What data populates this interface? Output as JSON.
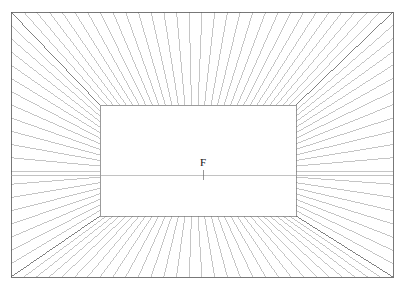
{
  "figure": {
    "type": "perspective-grid-diagram",
    "width": 405,
    "height": 284,
    "background_color": "#ffffff"
  },
  "labels": {
    "vanishing_point": "F"
  },
  "chart_data": {
    "type": "diagram",
    "projection": "one-point-perspective",
    "vanishing_point": {
      "label": "F",
      "x": 203,
      "y": 175
    },
    "horizon_line": {
      "y": 175,
      "x_start": 11,
      "x_end": 393
    },
    "outer_frame": {
      "x_left": 11,
      "y_top": 12,
      "x_right": 393,
      "y_bottom": 277
    },
    "back_wall": {
      "x_left": 100,
      "y_top": 105,
      "x_right": 296,
      "y_bottom": 216
    },
    "surfaces": [
      "ceiling",
      "floor",
      "left-wall",
      "right-wall",
      "back-wall"
    ],
    "grid": {
      "horizontal_divisions_top": 30,
      "vertical_divisions_side": 20,
      "depth_steps": 14,
      "line_color": "#8c8c8c",
      "line_width": 0.5,
      "back_wall_gridded": false
    },
    "annotations": [
      {
        "text": "F",
        "x": 203,
        "y": 170,
        "meaning": "vanishing point marker"
      }
    ]
  }
}
